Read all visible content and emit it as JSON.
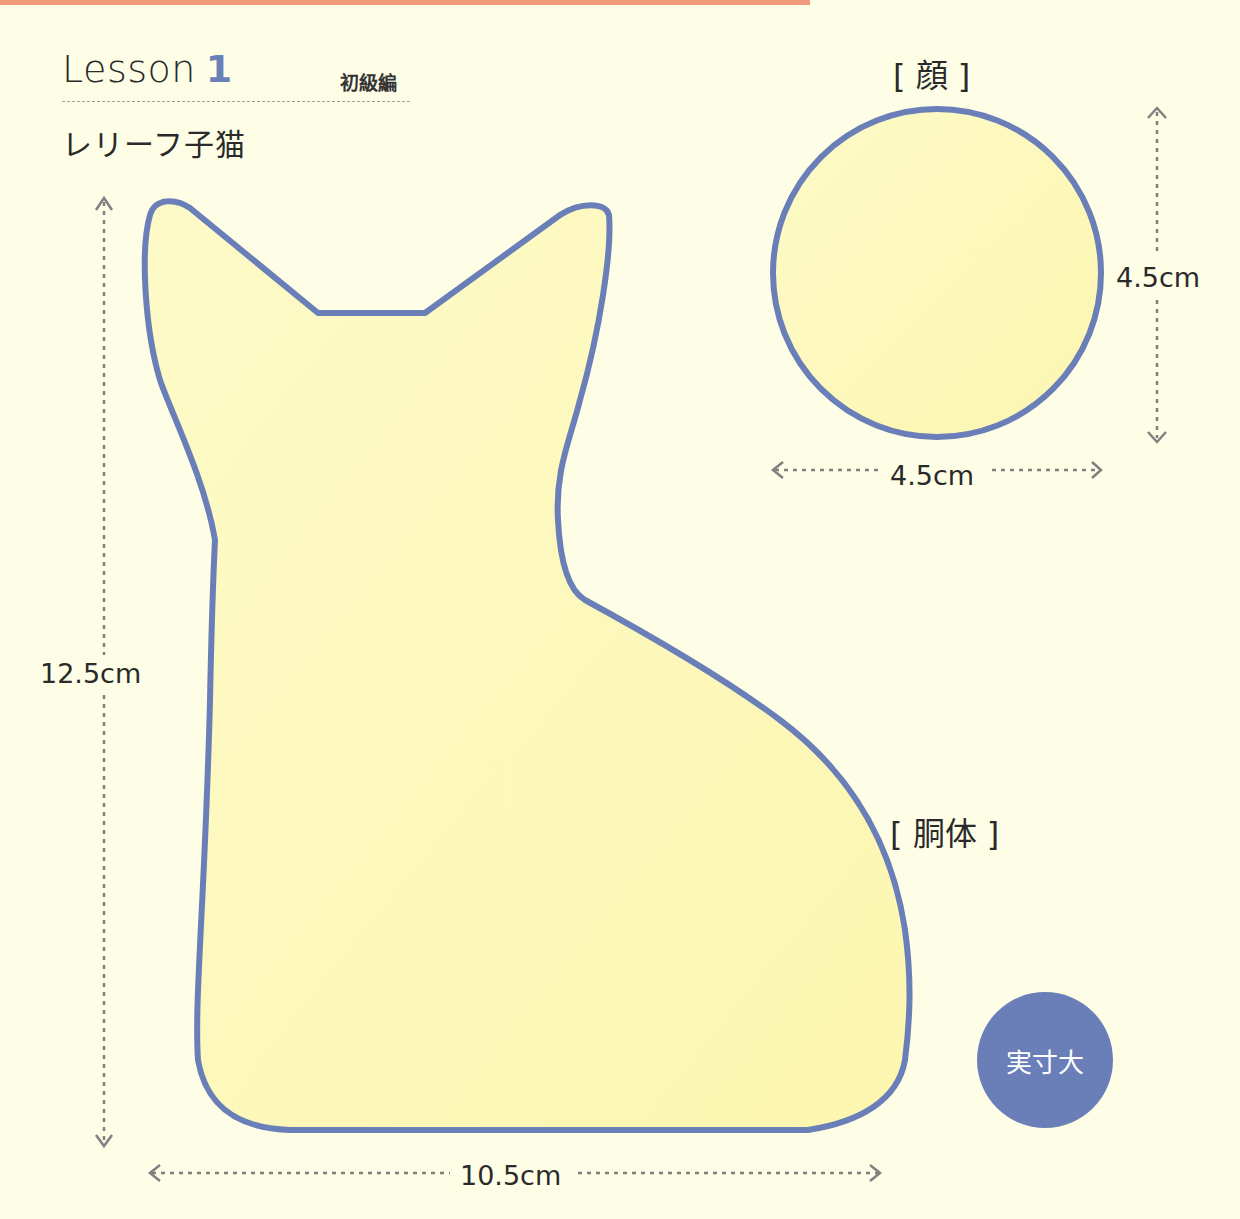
{
  "header": {
    "lesson_word": "Lesson",
    "lesson_number": "1",
    "level": "初級編",
    "subtitle": "レリーフ子猫"
  },
  "parts": {
    "face": {
      "label": "[ 顔 ]",
      "width": "4.5cm",
      "height": "4.5cm"
    },
    "body": {
      "label": "[ 胴体 ]",
      "width": "10.5cm",
      "height": "12.5cm"
    }
  },
  "badge": {
    "text": "実寸大"
  },
  "colors": {
    "background": "#fefde6",
    "shape_fill": "#fdf9be",
    "outline": "#6a7fb8",
    "accent_bar": "#f29a7a",
    "dimension_line": "#808080"
  }
}
